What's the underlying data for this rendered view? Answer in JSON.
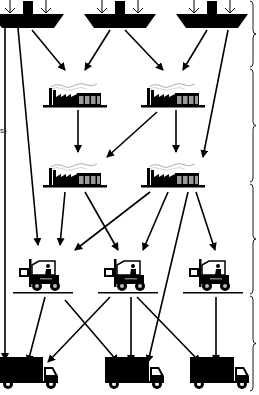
{
  "diagram": {
    "type": "supply-chain-network",
    "colors": {
      "ink": "#000000",
      "background": "#ffffff",
      "window": "#9a9a9a"
    },
    "fragment_text": "s)",
    "tiers": [
      {
        "name": "suppliers",
        "icon": "ship-icon",
        "nodes": [
          {
            "id": "S1",
            "x": 28,
            "y": 18
          },
          {
            "id": "S2",
            "x": 120,
            "y": 18
          },
          {
            "id": "S3",
            "x": 212,
            "y": 18
          }
        ]
      },
      {
        "name": "manufacturers-stage-1",
        "icon": "factory-icon",
        "nodes": [
          {
            "id": "F1",
            "x": 75,
            "y": 95
          },
          {
            "id": "F2",
            "x": 173,
            "y": 95
          }
        ]
      },
      {
        "name": "manufacturers-stage-2",
        "icon": "factory-icon",
        "nodes": [
          {
            "id": "F3",
            "x": 75,
            "y": 175
          },
          {
            "id": "F4",
            "x": 173,
            "y": 175
          }
        ]
      },
      {
        "name": "warehouses",
        "icon": "forklift-icon",
        "nodes": [
          {
            "id": "W1",
            "x": 43,
            "y": 273
          },
          {
            "id": "W2",
            "x": 128,
            "y": 273
          },
          {
            "id": "W3",
            "x": 213,
            "y": 273
          }
        ]
      },
      {
        "name": "distribution",
        "icon": "truck-icon",
        "nodes": [
          {
            "id": "T1",
            "x": 28,
            "y": 372
          },
          {
            "id": "T2",
            "x": 134,
            "y": 372
          },
          {
            "id": "T3",
            "x": 219,
            "y": 372
          }
        ]
      }
    ],
    "edges": [
      {
        "from": [
          5,
          28
        ],
        "to": [
          5,
          360
        ]
      },
      {
        "from": [
          18,
          28
        ],
        "to": [
          38,
          245
        ]
      },
      {
        "from": [
          32,
          30
        ],
        "to": [
          65,
          70
        ]
      },
      {
        "from": [
          110,
          30
        ],
        "to": [
          85,
          70
        ]
      },
      {
        "from": [
          125,
          30
        ],
        "to": [
          163,
          70
        ]
      },
      {
        "from": [
          207,
          30
        ],
        "to": [
          183,
          70
        ]
      },
      {
        "from": [
          228,
          30
        ],
        "to": [
          203,
          157
        ]
      },
      {
        "from": [
          78,
          110
        ],
        "to": [
          78,
          152
        ]
      },
      {
        "from": [
          157,
          112
        ],
        "to": [
          107,
          157
        ]
      },
      {
        "from": [
          176,
          110
        ],
        "to": [
          176,
          152
        ]
      },
      {
        "from": [
          65,
          192
        ],
        "to": [
          60,
          245
        ]
      },
      {
        "from": [
          85,
          192
        ],
        "to": [
          118,
          250
        ]
      },
      {
        "from": [
          150,
          192
        ],
        "to": [
          75,
          250
        ]
      },
      {
        "from": [
          168,
          192
        ],
        "to": [
          143,
          250
        ]
      },
      {
        "from": [
          188,
          192
        ],
        "to": [
          148,
          362
        ]
      },
      {
        "from": [
          196,
          192
        ],
        "to": [
          215,
          250
        ]
      },
      {
        "from": [
          45,
          297
        ],
        "to": [
          28,
          362
        ]
      },
      {
        "from": [
          65,
          300
        ],
        "to": [
          118,
          362
        ]
      },
      {
        "from": [
          110,
          297
        ],
        "to": [
          48,
          362
        ]
      },
      {
        "from": [
          131,
          297
        ],
        "to": [
          131,
          362
        ]
      },
      {
        "from": [
          137,
          297
        ],
        "to": [
          200,
          362
        ]
      },
      {
        "from": [
          216,
          297
        ],
        "to": [
          216,
          362
        ]
      }
    ],
    "braces": [
      {
        "y1": 0,
        "y2": 68
      },
      {
        "y1": 68,
        "y2": 183
      },
      {
        "y1": 183,
        "y2": 295
      },
      {
        "y1": 295,
        "y2": 392
      }
    ]
  }
}
